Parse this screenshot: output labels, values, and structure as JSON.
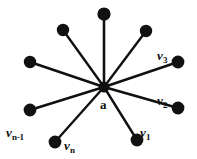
{
  "figure": {
    "type": "star-graph-diagram",
    "background_color": "#ffffff",
    "ink_color": "#111111",
    "width": 197,
    "height": 159
  },
  "hub": {
    "id": "a",
    "label": "a",
    "cx": 104,
    "cy": 87,
    "r": 5.5,
    "label_x": 100,
    "label_y": 98
  },
  "nodes": [
    {
      "id": "n-top-left",
      "label": "",
      "sub": "",
      "cx": 63,
      "cy": 30,
      "r": 6.2,
      "label_x": 0,
      "label_y": 0,
      "has_label": false
    },
    {
      "id": "n-top",
      "label": "",
      "sub": "",
      "cx": 104,
      "cy": 14,
      "r": 6.6,
      "label_x": 0,
      "label_y": 0,
      "has_label": false
    },
    {
      "id": "n-top-right",
      "label": "",
      "sub": "",
      "cx": 146,
      "cy": 31,
      "r": 6.2,
      "label_x": 0,
      "label_y": 0,
      "has_label": false
    },
    {
      "id": "v3",
      "label": "v",
      "sub": "3",
      "cx": 178,
      "cy": 62,
      "r": 6.4,
      "label_x": 157,
      "label_y": 47,
      "has_label": true
    },
    {
      "id": "v2",
      "label": "v",
      "sub": "2",
      "cx": 178,
      "cy": 108,
      "r": 6.4,
      "label_x": 157,
      "label_y": 92,
      "has_label": true
    },
    {
      "id": "v1",
      "label": "v",
      "sub": "1",
      "cx": 137,
      "cy": 140,
      "r": 6.4,
      "label_x": 140,
      "label_y": 124,
      "has_label": true
    },
    {
      "id": "vn",
      "label": "v",
      "sub": "n",
      "cx": 55,
      "cy": 142,
      "r": 6.4,
      "label_x": 64,
      "label_y": 137,
      "has_label": true
    },
    {
      "id": "vn-1",
      "label": "v",
      "sub": "n-1",
      "cx": 30,
      "cy": 110,
      "r": 6.4,
      "label_x": 6,
      "label_y": 124,
      "has_label": true
    },
    {
      "id": "n-left",
      "label": "",
      "sub": "",
      "cx": 30,
      "cy": 62,
      "r": 6.2,
      "label_x": 0,
      "label_y": 0,
      "has_label": false
    }
  ],
  "edges": [
    {
      "from": "a",
      "to": "n-top-left",
      "x1": 104,
      "y1": 87,
      "x2": 63,
      "y2": 30,
      "width": 2.4
    },
    {
      "from": "a",
      "to": "n-top",
      "x1": 104,
      "y1": 87,
      "x2": 104,
      "y2": 14,
      "width": 2.6
    },
    {
      "from": "a",
      "to": "n-top-right",
      "x1": 104,
      "y1": 87,
      "x2": 146,
      "y2": 31,
      "width": 2.4
    },
    {
      "from": "a",
      "to": "v3",
      "x1": 104,
      "y1": 87,
      "x2": 178,
      "y2": 62,
      "width": 2.6
    },
    {
      "from": "a",
      "to": "v2",
      "x1": 104,
      "y1": 87,
      "x2": 178,
      "y2": 108,
      "width": 2.6
    },
    {
      "from": "a",
      "to": "v1",
      "x1": 104,
      "y1": 87,
      "x2": 137,
      "y2": 140,
      "width": 2.4
    },
    {
      "from": "a",
      "to": "vn",
      "x1": 104,
      "y1": 87,
      "x2": 55,
      "y2": 142,
      "width": 2.4
    },
    {
      "from": "a",
      "to": "vn-1",
      "x1": 104,
      "y1": 87,
      "x2": 30,
      "y2": 110,
      "width": 2.6
    },
    {
      "from": "a",
      "to": "n-left",
      "x1": 104,
      "y1": 87,
      "x2": 30,
      "y2": 62,
      "width": 2.6
    }
  ]
}
